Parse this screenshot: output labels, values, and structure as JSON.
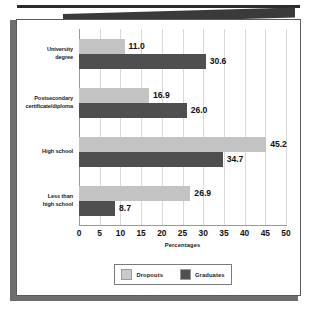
{
  "chart_data": {
    "type": "bar",
    "orientation": "horizontal",
    "title": "",
    "xlabel": "Percentages",
    "ylabel": "",
    "xlim": [
      0,
      50
    ],
    "xticks": [
      "0",
      "5",
      "10",
      "15",
      "20",
      "25",
      "30",
      "35",
      "40",
      "45",
      "50"
    ],
    "grid": true,
    "legend_position": "bottom-center",
    "categories": [
      "University\ndegree",
      "Postsecondary\ncertificate/diploma",
      "High school",
      "Less than\nhigh school"
    ],
    "series": [
      {
        "name": "Dropouts",
        "color": "#c3c3c3",
        "values": [
          11.0,
          16.9,
          45.2,
          26.9
        ],
        "labels": [
          "11.0",
          "16.9",
          "45.2",
          "26.9"
        ]
      },
      {
        "name": "Graduates",
        "color": "#4f4f4f",
        "values": [
          30.6,
          26.0,
          34.7,
          8.7
        ],
        "labels": [
          "30.6",
          "26.0",
          "34.7",
          "8.7"
        ]
      }
    ]
  }
}
